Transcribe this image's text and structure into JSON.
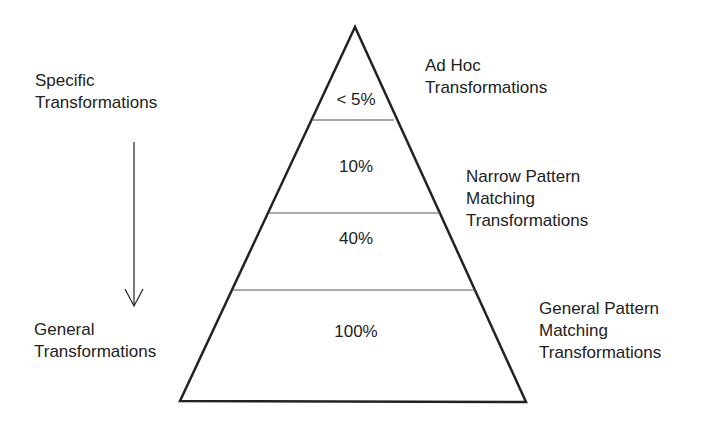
{
  "diagram": {
    "type": "pyramid",
    "left_labels": {
      "top": [
        "Specific",
        "Transformations"
      ],
      "bottom": [
        "General",
        "Transformations"
      ],
      "arrow": "arrow-down"
    },
    "tiers": [
      {
        "percent": "< 5%",
        "label": [
          "Ad Hoc",
          "Transformations"
        ]
      },
      {
        "percent": "10%",
        "label": [
          "Narrow Pattern",
          "Matching",
          "Transformations"
        ]
      },
      {
        "percent": "40%",
        "label": []
      },
      {
        "percent": "100%",
        "label": [
          "General Pattern",
          "Matching",
          "Transformations"
        ]
      }
    ],
    "colors": {
      "stroke": "#222222",
      "background": "#ffffff"
    }
  }
}
